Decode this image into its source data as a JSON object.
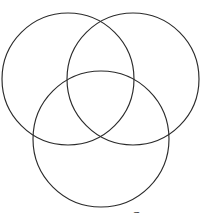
{
  "figure": {
    "type": "venn-diagram",
    "background_color": "#ffffff",
    "stroke_color": "#2b2b2b",
    "stroke_width": 1.15,
    "canvas": {
      "width": 201,
      "height": 221
    },
    "region_labels": [],
    "set_labels": [],
    "circles": [
      {
        "name": "top-left-circle",
        "cx": 68,
        "cy": 79,
        "r": 66
      },
      {
        "name": "top-right-circle",
        "cx": 133,
        "cy": 79,
        "r": 66
      },
      {
        "name": "bottom-circle",
        "cx": 101,
        "cy": 139,
        "r": 68
      }
    ]
  },
  "caption": {
    "partial_text": "U",
    "note_visible": false
  }
}
